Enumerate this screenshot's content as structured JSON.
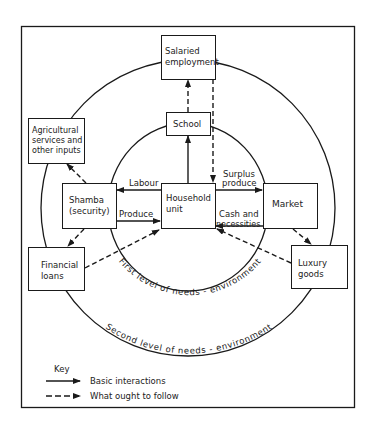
{
  "diagram": {
    "nodes": {
      "salaried": {
        "line1": "Salaried",
        "line2": "employment"
      },
      "school": {
        "label": "School"
      },
      "agricultural": {
        "line1": "Agricultural",
        "line2": "services and",
        "line3": "other inputs"
      },
      "shamba": {
        "line1": "Shamba",
        "line2": "(security)"
      },
      "household": {
        "line1": "Household",
        "line2": "unit"
      },
      "market": {
        "label": "Market"
      },
      "financial": {
        "line1": "Financial",
        "line2": "loans"
      },
      "luxury": {
        "line1": "Luxury",
        "line2": "goods"
      }
    },
    "edge_labels": {
      "labour": "Labour",
      "produce": "Produce",
      "surplus1": "Surplus",
      "surplus2": "produce",
      "cash1": "Cash and",
      "cash2": "necessities"
    },
    "rings": {
      "inner": "First level of needs - environment",
      "outer": "Second level of needs - environment"
    },
    "edges": [
      {
        "from": "Household unit",
        "to": "School",
        "style": "solid"
      },
      {
        "from": "School",
        "to": "Salaried employment",
        "style": "dashed"
      },
      {
        "from": "Salaried employment",
        "to": "Household unit",
        "style": "dashed"
      },
      {
        "from": "Household unit",
        "to": "Shamba (security)",
        "label": "Labour",
        "style": "solid"
      },
      {
        "from": "Shamba (security)",
        "to": "Household unit",
        "label": "Produce",
        "style": "solid"
      },
      {
        "from": "Household unit",
        "to": "Market",
        "label": "Surplus produce",
        "style": "solid"
      },
      {
        "from": "Market",
        "to": "Household unit",
        "label": "Cash and necessities",
        "style": "solid"
      },
      {
        "from": "Shamba (security)",
        "to": "Agricultural services and other inputs",
        "style": "dashed"
      },
      {
        "from": "Shamba (security)",
        "to": "Financial loans",
        "style": "dashed"
      },
      {
        "from": "Financial loans",
        "to": "Household unit",
        "style": "dashed"
      },
      {
        "from": "Market",
        "to": "Luxury goods",
        "style": "dashed"
      },
      {
        "from": "Luxury goods",
        "to": "Household unit",
        "style": "dashed"
      }
    ]
  },
  "key": {
    "title": "Key",
    "solid": "Basic interactions",
    "dashed": "What ought to follow"
  }
}
